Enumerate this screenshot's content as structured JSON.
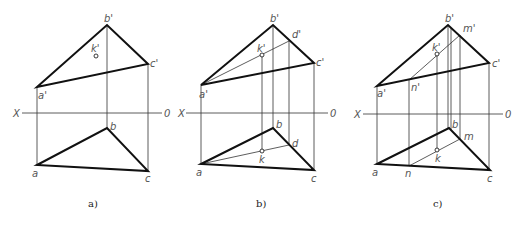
{
  "figure": {
    "panels": [
      {
        "id": "a",
        "caption": "a)",
        "axis": {
          "x_label": "X",
          "o_label": "0"
        },
        "labels": {
          "b_prime": "b'",
          "c_prime": "c'",
          "a_prime": "a'",
          "k_prime": "k'",
          "a": "a",
          "b": "b",
          "c": "c"
        }
      },
      {
        "id": "b",
        "caption": "b)",
        "axis": {
          "x_label": "X",
          "o_label": "0"
        },
        "labels": {
          "b_prime": "b'",
          "c_prime": "c'",
          "a_prime": "a'",
          "k_prime": "k'",
          "d_prime": "d'",
          "a": "a",
          "b": "b",
          "c": "c",
          "k": "k",
          "d": "d"
        }
      },
      {
        "id": "c",
        "caption": "c)",
        "axis": {
          "x_label": "X",
          "o_label": "0"
        },
        "labels": {
          "b_prime": "b'",
          "c_prime": "c'",
          "a_prime": "a'",
          "k_prime": "k'",
          "m_prime": "m'",
          "n_prime": "n'",
          "a": "a",
          "b": "b",
          "c": "c",
          "k": "k",
          "m": "m",
          "n": "n"
        }
      }
    ]
  }
}
